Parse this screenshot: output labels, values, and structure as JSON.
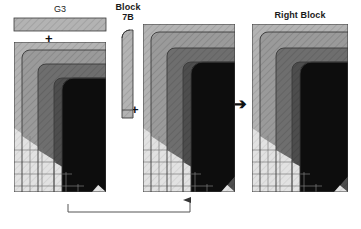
{
  "figure": {
    "type": "block-composition-diagram",
    "background": "#ffffff"
  },
  "labels": {
    "g3": "G3",
    "block7b": "Block\n7B",
    "right_block": "Right Block"
  },
  "operators": {
    "plus_top": "+",
    "plus_middle": "+",
    "arrow_right": "➔"
  },
  "colors": {
    "layer1": "#b3b3b3",
    "layer2": "#9a9a9a",
    "layer3": "#6e6e6e",
    "layer4": "#4d4d4d",
    "core": "#0d0d0d",
    "stair": "#e0e0e0",
    "outline": "#3a3a3a",
    "hatch": "#8f8f8f",
    "connector": "#555555",
    "text": "#1a1a1a"
  },
  "panels": [
    {
      "name": "left-panel",
      "title": "G3",
      "bar": {
        "x": 14,
        "y": 18,
        "w": 92,
        "h": 13,
        "fill": "layer1"
      },
      "operator": "+",
      "block": {
        "x": 14,
        "y": 42,
        "w": 92,
        "h": 150
      }
    },
    {
      "name": "strip-panel",
      "title": "Block\n7B",
      "strip": {
        "x": 122,
        "y": 30,
        "w": 11,
        "h": 88,
        "fill": "layer1"
      },
      "operator": "+"
    },
    {
      "name": "middle-panel",
      "title": "",
      "block": {
        "x": 143,
        "y": 24,
        "w": 92,
        "h": 168
      },
      "operator": "➔"
    },
    {
      "name": "right-panel",
      "title": "Right Block",
      "block": {
        "x": 252,
        "y": 24,
        "w": 96,
        "h": 168
      }
    }
  ],
  "connector": {
    "name": "feedback-arrow",
    "from_x": 68,
    "to_x": 190,
    "y": 212,
    "arrow": "up"
  },
  "legend_note": ""
}
